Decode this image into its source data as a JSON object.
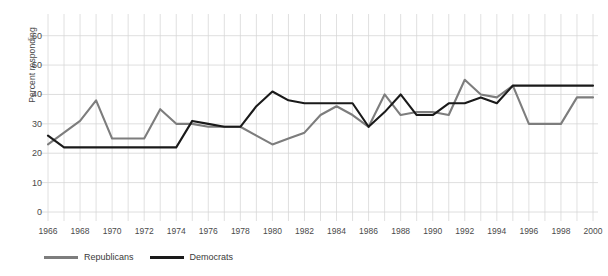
{
  "chart_data": {
    "type": "line",
    "title": "",
    "xlabel": "",
    "ylabel": "Percent responding",
    "ylim": [
      0,
      65
    ],
    "yticks": [
      0,
      10,
      20,
      30,
      40,
      50,
      60
    ],
    "xlim": [
      1966,
      2000
    ],
    "xticks": [
      1966,
      1968,
      1970,
      1972,
      1974,
      1976,
      1978,
      1980,
      1982,
      1984,
      1986,
      1988,
      1990,
      1992,
      1994,
      1996,
      1998,
      2000
    ],
    "x": [
      1966,
      1967,
      1968,
      1969,
      1970,
      1971,
      1972,
      1973,
      1974,
      1975,
      1976,
      1977,
      1978,
      1979,
      1980,
      1981,
      1982,
      1983,
      1984,
      1985,
      1986,
      1987,
      1988,
      1989,
      1990,
      1991,
      1992,
      1993,
      1994,
      1995,
      1996,
      1997,
      1998,
      1999,
      2000
    ],
    "grid": true,
    "grid_x_interval": 1,
    "legend_position": "bottom-left",
    "series": [
      {
        "name": "Republicans",
        "color": "#7d7d7d",
        "values": [
          23,
          27,
          31,
          38,
          25,
          25,
          25,
          35,
          30,
          30,
          29,
          29,
          29,
          26,
          23,
          25,
          27,
          33,
          36,
          33,
          29,
          40,
          33,
          34,
          34,
          33,
          45,
          40,
          39,
          43,
          30,
          30,
          30,
          39,
          39
        ]
      },
      {
        "name": "Democrats",
        "color": "#1a1a1a",
        "values": [
          26,
          22,
          22,
          22,
          22,
          22,
          22,
          22,
          22,
          31,
          30,
          29,
          29,
          36,
          41,
          38,
          37,
          37,
          37,
          37,
          29,
          34,
          40,
          33,
          33,
          37,
          37,
          39,
          37,
          43,
          43,
          43,
          43,
          43,
          43
        ]
      }
    ]
  },
  "legend": {
    "items": [
      {
        "label": "Republicans",
        "color": "#7d7d7d"
      },
      {
        "label": "Democrats",
        "color": "#1a1a1a"
      }
    ]
  }
}
